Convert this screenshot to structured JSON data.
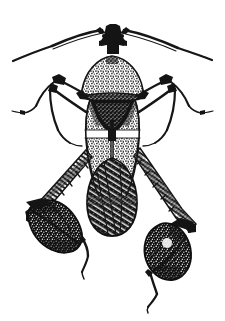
{
  "figure": {
    "title": "Leaf-footed bug",
    "subject_common_name": "Leaf-footed bug",
    "subject_family": "Coreidae",
    "medium": "black-and-white stippled pen-and-ink line drawing",
    "view": "dorsal view",
    "background_color": "#ffffff",
    "ink_color": "#141414",
    "canvas": {
      "width": 225,
      "height": 321
    },
    "caption": "",
    "label_text": "",
    "visible_text": []
  },
  "anatomy": {
    "parts": [
      {
        "name": "head",
        "label": "head"
      },
      {
        "name": "antenna-left",
        "label": "left antenna"
      },
      {
        "name": "antenna-right",
        "label": "right antenna"
      },
      {
        "name": "pronotum",
        "label": "pronotum"
      },
      {
        "name": "scutellum",
        "label": "scutellum"
      },
      {
        "name": "hemelytron-left",
        "label": "left forewing"
      },
      {
        "name": "hemelytron-right",
        "label": "right forewing"
      },
      {
        "name": "pale-wing-band",
        "label": "pale transverse band"
      },
      {
        "name": "membrane",
        "label": "wing membrane"
      },
      {
        "name": "foreleg-left",
        "label": "left foreleg"
      },
      {
        "name": "foreleg-right",
        "label": "right foreleg"
      },
      {
        "name": "midleg-left",
        "label": "left midleg"
      },
      {
        "name": "midleg-right",
        "label": "right midleg"
      },
      {
        "name": "hindleg-left",
        "label": "left hind leg"
      },
      {
        "name": "hindleg-right",
        "label": "right hind leg"
      },
      {
        "name": "leaf-expansion-left",
        "label": "left leaf-like tibial expansion"
      },
      {
        "name": "leaf-expansion-right",
        "label": "right leaf-like tibial expansion"
      },
      {
        "name": "tarsus-left",
        "label": "left hind tarsus"
      },
      {
        "name": "tarsus-right",
        "label": "right hind tarsus"
      }
    ]
  },
  "colors": {
    "ink": "#141414",
    "ink_soft": "#2b2b2b",
    "paper": "#ffffff"
  }
}
